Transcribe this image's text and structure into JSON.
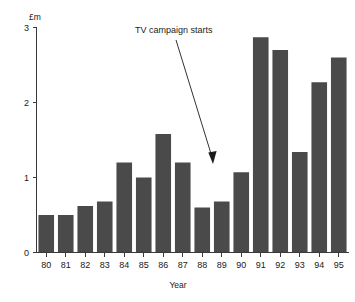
{
  "chart_data": {
    "type": "bar",
    "title": "",
    "subtitle": "",
    "xlabel": "Year",
    "ylabel": "£m",
    "categories": [
      "80",
      "81",
      "82",
      "83",
      "84",
      "85",
      "86",
      "87",
      "88",
      "89",
      "90",
      "91",
      "92",
      "93",
      "94",
      "95"
    ],
    "values": [
      0.5,
      0.5,
      0.62,
      0.68,
      1.2,
      1.0,
      1.58,
      1.2,
      0.6,
      0.68,
      1.07,
      2.87,
      2.7,
      1.34,
      2.27,
      2.6
    ],
    "ylim": [
      0,
      3
    ],
    "xlim_categories": 16,
    "y_ticks": [
      "0",
      "1",
      "2",
      "3"
    ],
    "y_tick_values": [
      0,
      1,
      2,
      3
    ],
    "grid": false,
    "legend": false,
    "legend_position": "none",
    "bar_color": "#4a4a4a",
    "background_color": "#ffffff",
    "axis_color": "#3a3a3a",
    "annotations": [
      {
        "text": "TV campaign starts",
        "points_to_category": "90",
        "points_to_value": 1.3
      }
    ]
  },
  "axes": {
    "y_unit_label": "£m",
    "x_axis_title": "Year"
  }
}
